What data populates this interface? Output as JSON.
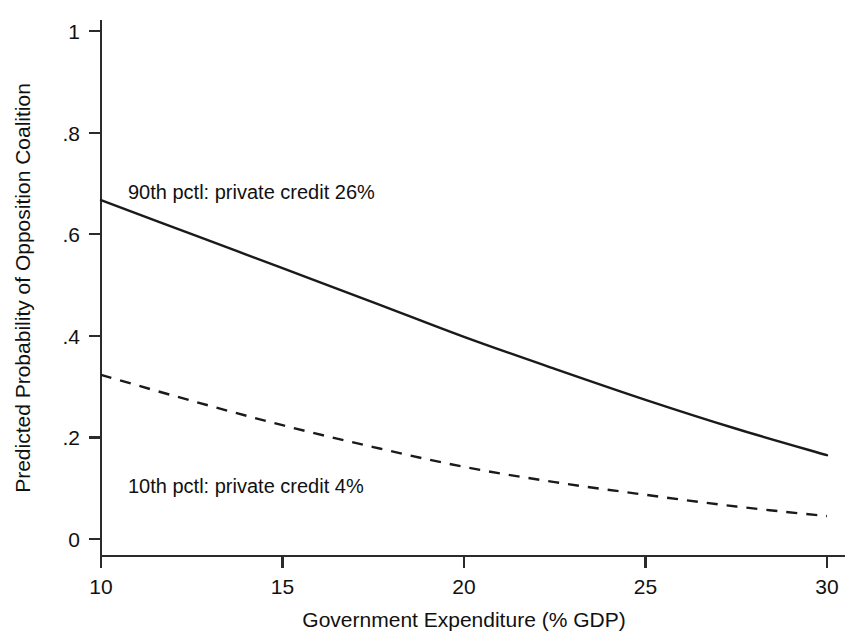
{
  "chart_data": {
    "type": "line",
    "title": "",
    "subtitle": "",
    "xlabel": "Government Expenditure (% GDP)",
    "ylabel": "Predicted Probability of Opposition Coalition",
    "xlim": [
      10,
      30
    ],
    "ylim": [
      0,
      1
    ],
    "grid": false,
    "legend_position": "inline-annotations",
    "x_ticks": [
      "10",
      "15",
      "20",
      "25",
      "30"
    ],
    "x_tick_values": [
      10,
      15,
      20,
      25,
      30
    ],
    "y_ticks": [
      "0",
      ".2",
      ".4",
      ".6",
      ".8",
      "1"
    ],
    "y_tick_values": [
      0,
      0.2,
      0.4,
      0.6,
      0.8,
      1
    ],
    "x": [
      10,
      12.5,
      15,
      17.5,
      20,
      22.5,
      25,
      27.5,
      30
    ],
    "series": [
      {
        "name": "90th pctl: private credit 26%",
        "style": "solid",
        "color": "#1a1a1a",
        "values": [
          0.667,
          0.6,
          0.533,
          0.466,
          0.398,
          0.335,
          0.274,
          0.217,
          0.165
        ]
      },
      {
        "name": "10th pctl: private credit 4%",
        "style": "dashed",
        "color": "#1a1a1a",
        "values": [
          0.323,
          0.272,
          0.224,
          0.181,
          0.142,
          0.112,
          0.087,
          0.064,
          0.045
        ]
      }
    ],
    "annotations": [
      {
        "text": "90th pctl: private credit 26%",
        "x_px": 128,
        "y_px": 199,
        "series": "90th pctl: private credit 26%"
      },
      {
        "text": "10th pctl: private credit 4%",
        "x_px": 128,
        "y_px": 493,
        "series": "10th pctl: private credit 4%"
      }
    ]
  },
  "axes": {
    "x_title": "Government Expenditure (% GDP)",
    "y_title": "Predicted Probability of Opposition Coalition",
    "x_tick_labels": [
      "10",
      "15",
      "20",
      "25",
      "30"
    ],
    "y_tick_labels": [
      "0",
      ".2",
      ".4",
      ".6",
      ".8",
      "1"
    ]
  },
  "colors": {
    "background": "#ffffff",
    "axis": "#2b2b2b",
    "line": "#1a1a1a",
    "text": "#111111"
  }
}
